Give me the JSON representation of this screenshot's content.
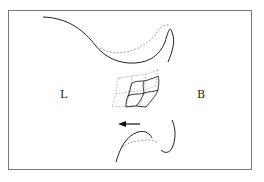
{
  "diagram": {
    "labels": {
      "left": "L",
      "right": "B"
    },
    "arrow_direction": "left",
    "line_styles": {
      "solid": "#222222",
      "dashed": "#888888"
    }
  }
}
